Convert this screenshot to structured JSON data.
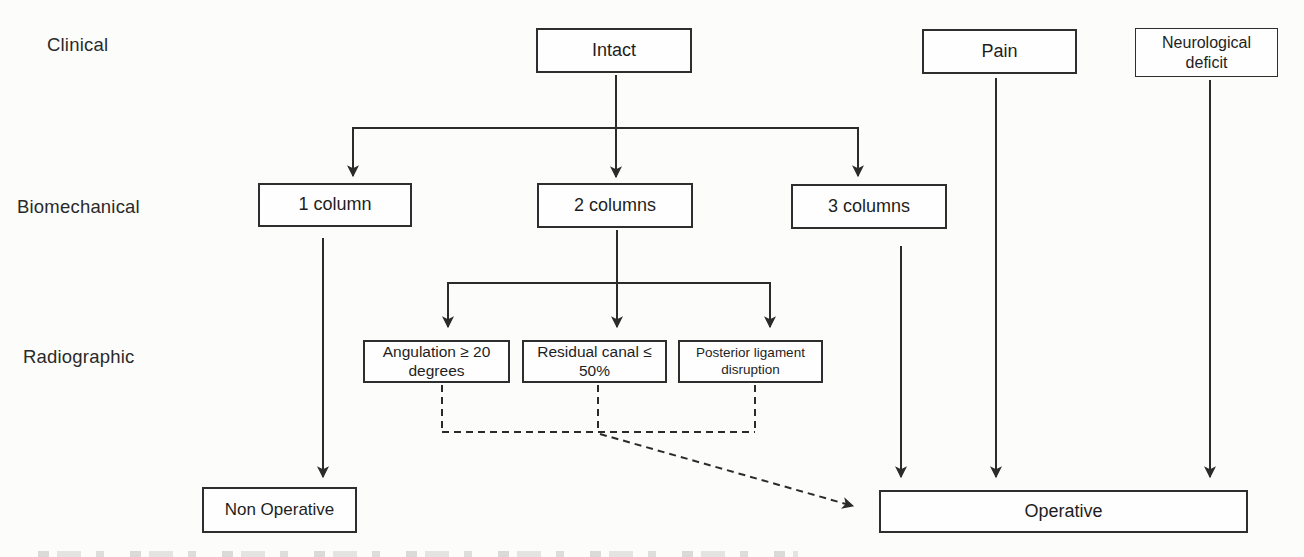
{
  "rows": {
    "clinical": "Clinical",
    "biomechanical": "Biomechanical",
    "radiographic": "Radiographic"
  },
  "nodes": {
    "intact": "Intact",
    "pain": "Pain",
    "neurological_deficit": "Neurological deficit",
    "one_column": "1 column",
    "two_columns": "2 columns",
    "three_columns": "3 columns",
    "angulation": "Angulation ≥ 20 degrees",
    "residual_canal": "Residual canal ≤ 50%",
    "posterior_ligament": "Posterior ligament disruption",
    "non_operative": "Non Operative",
    "operative": "Operative"
  },
  "colors": {
    "background": "#fcfcfa",
    "line": "#2b2b2b",
    "box_border": "#2e2e2e",
    "text": "#1e1e1e"
  }
}
